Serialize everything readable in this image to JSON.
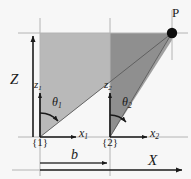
{
  "figure": {
    "name": "two-frame-triangulation-geometry",
    "background": "#f7f7f7"
  },
  "colors": {
    "fill_light": "#b9b9b9",
    "fill_dark": "#8f8f8f",
    "guide": "#b0b0b0",
    "axis": "#1a1a1a",
    "label": "#1a1a1a"
  },
  "labels": {
    "Z": "Z",
    "X": "X",
    "P": "P",
    "b": "b",
    "z1": "z",
    "z1_sub": "1",
    "z2": "z",
    "z2_sub": "2",
    "x1": "x",
    "x1_sub": "1",
    "x2": "x",
    "x2_sub": "2",
    "theta1": "θ",
    "theta1_sub": "1",
    "theta2": "θ",
    "theta2_sub": "2",
    "frame1": "{1}",
    "frame2": "{2}"
  },
  "geometry": {
    "baseline_y": 137,
    "top_y": 33,
    "frame1_x": 40,
    "frame2_x": 110,
    "point_p_x": 172,
    "point_p_y": 33,
    "baseline_b_label": "b",
    "world_axis_x_y": 170,
    "dim_line_b_y": 163
  }
}
